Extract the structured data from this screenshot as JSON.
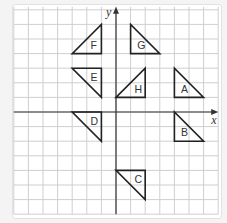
{
  "diagram": {
    "type": "coordinate-grid",
    "axes": {
      "x_label": "x",
      "y_label": "y"
    },
    "grid": {
      "x_range": [
        -7,
        7
      ],
      "y_range": [
        -7,
        7
      ],
      "cell_size_px": 14.6
    },
    "triangles": [
      {
        "label": "A",
        "vertices": [
          [
            4,
            3
          ],
          [
            4,
            1
          ],
          [
            6,
            1
          ]
        ],
        "label_pos": [
          4.7,
          1.6
        ]
      },
      {
        "label": "B",
        "vertices": [
          [
            4,
            0
          ],
          [
            4,
            -2
          ],
          [
            6,
            -2
          ]
        ],
        "label_pos": [
          4.7,
          -1.4
        ]
      },
      {
        "label": "C",
        "vertices": [
          [
            0,
            -4
          ],
          [
            2,
            -4
          ],
          [
            2,
            -6
          ]
        ],
        "label_pos": [
          1.5,
          -4.6
        ]
      },
      {
        "label": "D",
        "vertices": [
          [
            -3,
            0
          ],
          [
            -1,
            0
          ],
          [
            -1,
            -2
          ]
        ],
        "label_pos": [
          -1.5,
          -0.6
        ]
      },
      {
        "label": "E",
        "vertices": [
          [
            -3,
            3
          ],
          [
            -1,
            3
          ],
          [
            -1,
            1
          ]
        ],
        "label_pos": [
          -1.5,
          2.4
        ]
      },
      {
        "label": "F",
        "vertices": [
          [
            -1,
            6
          ],
          [
            -1,
            4
          ],
          [
            -3,
            4
          ]
        ],
        "label_pos": [
          -1.5,
          4.6
        ]
      },
      {
        "label": "G",
        "vertices": [
          [
            1,
            6
          ],
          [
            1,
            4
          ],
          [
            3,
            4
          ]
        ],
        "label_pos": [
          1.7,
          4.6
        ]
      },
      {
        "label": "H",
        "vertices": [
          [
            0,
            1
          ],
          [
            2,
            3
          ],
          [
            2,
            1
          ]
        ],
        "label_pos": [
          1.5,
          1.6
        ]
      }
    ]
  }
}
